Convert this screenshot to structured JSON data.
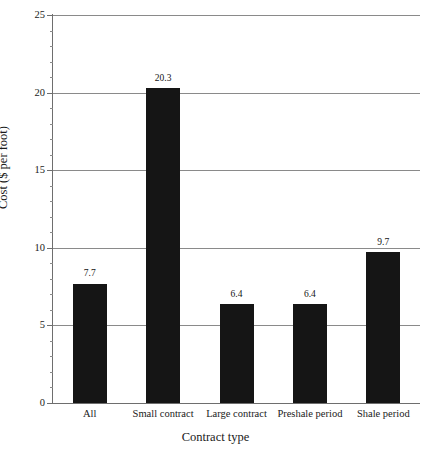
{
  "chart_data": {
    "type": "bar",
    "title": "",
    "xlabel": "Contract type",
    "ylabel": "Cost ($ per foot)",
    "categories": [
      "All",
      "Small contract",
      "Large contract",
      "Preshale period",
      "Shale period"
    ],
    "values": [
      7.7,
      20.3,
      6.4,
      6.4,
      9.7
    ],
    "value_labels": [
      "7.7",
      "20.3",
      "6.4",
      "6.4",
      "9.7"
    ],
    "ylim": [
      0,
      25
    ],
    "ytick_labels": [
      "0",
      "5",
      "10",
      "15",
      "20",
      "25"
    ],
    "ytick_values": [
      0,
      5,
      10,
      15,
      20,
      25
    ],
    "yminor_interval": 1,
    "grid": "horizontal-major",
    "legend": "none",
    "bar_color": "#151515",
    "grid_color": "#8a8a8a",
    "axis_color": "#6e6e6e",
    "background": "#ffffff"
  }
}
